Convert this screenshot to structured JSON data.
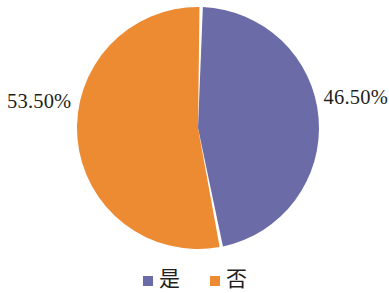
{
  "chart_data": {
    "type": "pie",
    "title": "",
    "subtitle": "",
    "xlabel": "",
    "ylabel": "",
    "grid": false,
    "legend_position": "bottom",
    "categories": [
      "是",
      "否"
    ],
    "values": [
      46.5,
      53.5
    ],
    "slices": [
      {
        "name": "是",
        "value": 46.5,
        "data_label": "46.50%",
        "color": "#6b6ba8",
        "label_position": "right"
      },
      {
        "name": "否",
        "value": 53.5,
        "data_label": "53.50%",
        "color": "#ed8b33",
        "label_position": "left"
      }
    ],
    "legend": [
      {
        "label": "是",
        "color": "#6b6ba8",
        "marker": "square"
      },
      {
        "label": "否",
        "color": "#ed8b33",
        "marker": "square"
      }
    ],
    "annotations": [],
    "units": "percent",
    "total": 100.0
  },
  "labels": {
    "left_percent": "53.50%",
    "right_percent": "46.50%"
  },
  "legend": {
    "items": [
      {
        "label": "是",
        "color": "#6b6ba8"
      },
      {
        "label": "否",
        "color": "#ed8b33"
      }
    ]
  },
  "colors": {
    "series_purple": "#6b6ba8",
    "series_orange": "#ed8b33",
    "background": "#ffffff",
    "text": "#231f20"
  },
  "geometry": {
    "center_x": 198,
    "center_y": 128,
    "radius": 121,
    "start_angle_deg": 1.5,
    "gap_deg": 1.6
  }
}
